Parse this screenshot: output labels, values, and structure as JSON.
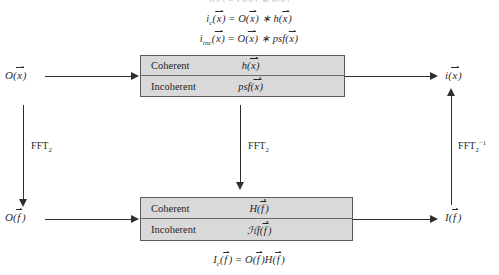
{
  "diagram": {
    "cropped_top_equation": "i(x) = O(x) ∗ h(x)",
    "equations": {
      "coherent_spatial": "i_c(x⃗) = O(x⃗) ∗ h(x⃗)",
      "incoherent_spatial": "i_inc(x⃗) = O(x⃗) ∗ psf(x⃗)",
      "frequency": "I_c(f⃗) = O(f⃗)H(f⃗)"
    },
    "nodes": {
      "input_spatial": "O(x⃗)",
      "output_spatial": "i(x⃗)",
      "input_frequency": "O(f⃗)",
      "output_frequency": "I(f⃗)"
    },
    "boxes": [
      {
        "id": "spatial-domain-box",
        "rows": [
          {
            "name": "Coherent",
            "function": "h(x⃗)"
          },
          {
            "name": "Incoherent",
            "function": "psf(x⃗)"
          }
        ]
      },
      {
        "id": "frequency-domain-box",
        "rows": [
          {
            "name": "Coherent",
            "function": "H(f⃗)"
          },
          {
            "name": "Incoherent",
            "function": "ℋf(f⃗)"
          }
        ]
      }
    ],
    "transform_labels": {
      "left": "FFT₂",
      "center": "FFT₂",
      "right": "FFT₂⁻¹"
    },
    "colors": {
      "box_fill": "#d9d9d9",
      "box_border": "#5a5a5a",
      "line": "#2f2f2f",
      "text": "#1f1f1f",
      "background": "#ffffff"
    }
  }
}
